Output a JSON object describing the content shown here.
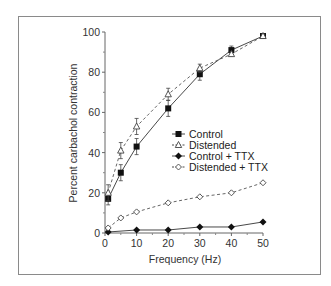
{
  "chart_data": {
    "type": "line",
    "title": "",
    "xlabel": "Frequency (Hz)",
    "ylabel": "Percent carbachol contraction",
    "xlim": [
      0,
      50
    ],
    "ylim": [
      0,
      100
    ],
    "xticks": [
      0,
      10,
      20,
      30,
      40,
      50
    ],
    "yticks": [
      0,
      20,
      40,
      60,
      80,
      100
    ],
    "grid": false,
    "legend_position": "center-right inside plot",
    "series": [
      {
        "name": "Control",
        "marker": "filled-square",
        "line": "solid",
        "x": [
          1,
          5,
          10,
          20,
          30,
          40,
          50
        ],
        "y": [
          17,
          30,
          43,
          62,
          79,
          91,
          98
        ],
        "err": [
          3,
          4,
          4,
          4,
          3,
          2,
          1
        ]
      },
      {
        "name": "Distended",
        "marker": "open-triangle",
        "line": "dashed",
        "x": [
          1,
          5,
          10,
          20,
          30,
          40,
          50
        ],
        "y": [
          20,
          41,
          53,
          69,
          82,
          89,
          98
        ],
        "err": [
          4,
          4,
          4,
          3,
          2,
          1,
          1
        ]
      },
      {
        "name": "Control + TTX",
        "marker": "filled-diamond",
        "line": "solid",
        "x": [
          1,
          10,
          20,
          30,
          40,
          50
        ],
        "y": [
          0.5,
          1.5,
          1.5,
          3,
          3,
          5.5
        ],
        "err": [
          0,
          0,
          0,
          0,
          0,
          0
        ]
      },
      {
        "name": "Distended + TTX",
        "marker": "open-diamond",
        "line": "dashed",
        "x": [
          1,
          5,
          10,
          20,
          30,
          40,
          50
        ],
        "y": [
          2.5,
          7.5,
          10.5,
          15,
          18,
          20,
          25
        ],
        "err": [
          0,
          0,
          0,
          0,
          0,
          0,
          0
        ]
      }
    ]
  }
}
